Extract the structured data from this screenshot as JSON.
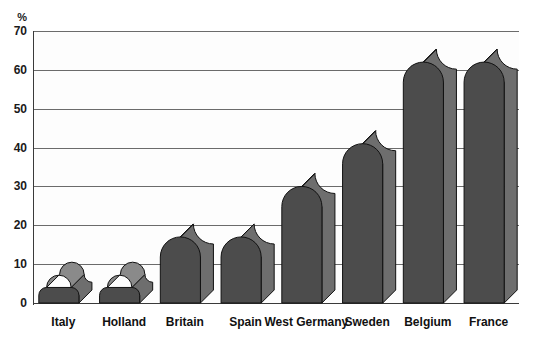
{
  "chart_data": {
    "type": "bar",
    "title": "",
    "subtitle": "",
    "xlabel": "",
    "ylabel": "%",
    "ylim": [
      0,
      70
    ],
    "ytick_step": 10,
    "yticks": [
      0,
      10,
      20,
      30,
      40,
      50,
      60,
      70
    ],
    "ytick_labels": [
      "0",
      "10",
      "20",
      "30",
      "40",
      "50",
      "60",
      "70"
    ],
    "grid": true,
    "legend": false,
    "legend_position": "none",
    "categories": [
      "Italy",
      "Holland",
      "Britain",
      "Spain",
      "West Germany",
      "Sweden",
      "Belgium",
      "France"
    ],
    "values": [
      4,
      4,
      17,
      17,
      30,
      41,
      62,
      62
    ],
    "series": [
      {
        "name": "",
        "values": [
          4,
          4,
          17,
          17,
          30,
          41,
          62,
          62
        ]
      }
    ],
    "style": {
      "bar_face_color": "#4c4c4c",
      "bar_side_color": "#6e6e6e",
      "bar_top_color": "#8a8a8a",
      "outline_color": "#111111",
      "gridline_color": "#6b6b6b",
      "axis_color": "#3a3a3a",
      "plot_background": "#fdfdfd",
      "page_background": "#ffffff",
      "bar_shape": "rounded-top-3d"
    }
  },
  "axis": {
    "unit_label": "%",
    "tick_labels": [
      "70",
      "60",
      "50",
      "40",
      "30",
      "20",
      "10",
      "0"
    ]
  },
  "categories_labels": [
    "Italy",
    "Holland",
    "Britain",
    "Spain",
    "West Germany",
    "Sweden",
    "Belgium",
    "France"
  ]
}
